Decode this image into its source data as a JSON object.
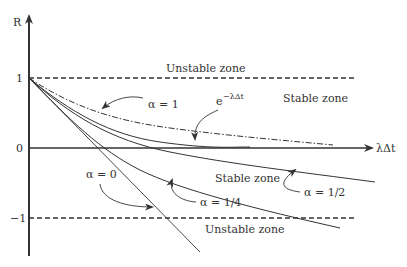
{
  "diagram": {
    "axes": {
      "y_label": "R",
      "x_label": "λΔt",
      "y_ticks": [
        "1",
        "0",
        "−1"
      ]
    },
    "zones": {
      "unstable_top": "Unstable zone",
      "stable_upper": "Stable zone",
      "stable_lower": "Stable zone",
      "unstable_bottom": "Unstable zone"
    },
    "curves": {
      "alpha_1": "α = 1",
      "exact": "e",
      "exact_exp": "−λΔt",
      "alpha_half": "α = 1/2",
      "alpha_quarter": "α = 1/4",
      "alpha_0": "α = 0"
    },
    "colors": {
      "ink": "#333333",
      "background": "#ffffff"
    }
  }
}
